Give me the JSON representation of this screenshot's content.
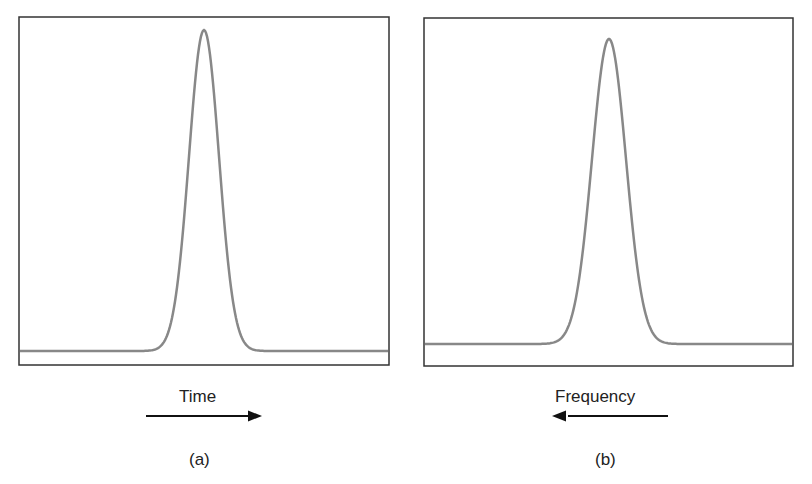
{
  "panels": [
    {
      "id": "a",
      "caption": "(a)",
      "axis_label": "Time",
      "arrow_direction": "right",
      "curve": "gaussian pulse",
      "line_color": "#888888",
      "frame_color": "#333333"
    },
    {
      "id": "b",
      "caption": "(b)",
      "axis_label": "Frequency",
      "arrow_direction": "left",
      "curve": "gaussian pulse",
      "line_color": "#888888",
      "frame_color": "#333333"
    }
  ],
  "chart_data": [
    {
      "type": "line",
      "title": "(a)",
      "xlabel": "Time",
      "ylabel": "",
      "grid": false,
      "series": [
        {
          "name": "pulse",
          "shape": "gaussian",
          "center_frac": 0.5,
          "peak_frac": 0.96,
          "baseline_frac": 0.04,
          "width_frac": 0.06
        }
      ]
    },
    {
      "type": "line",
      "title": "(b)",
      "xlabel": "Frequency",
      "ylabel": "",
      "grid": false,
      "series": [
        {
          "name": "spectrum",
          "shape": "gaussian",
          "center_frac": 0.5,
          "peak_frac": 0.93,
          "baseline_frac": 0.06,
          "width_frac": 0.065
        }
      ]
    }
  ]
}
